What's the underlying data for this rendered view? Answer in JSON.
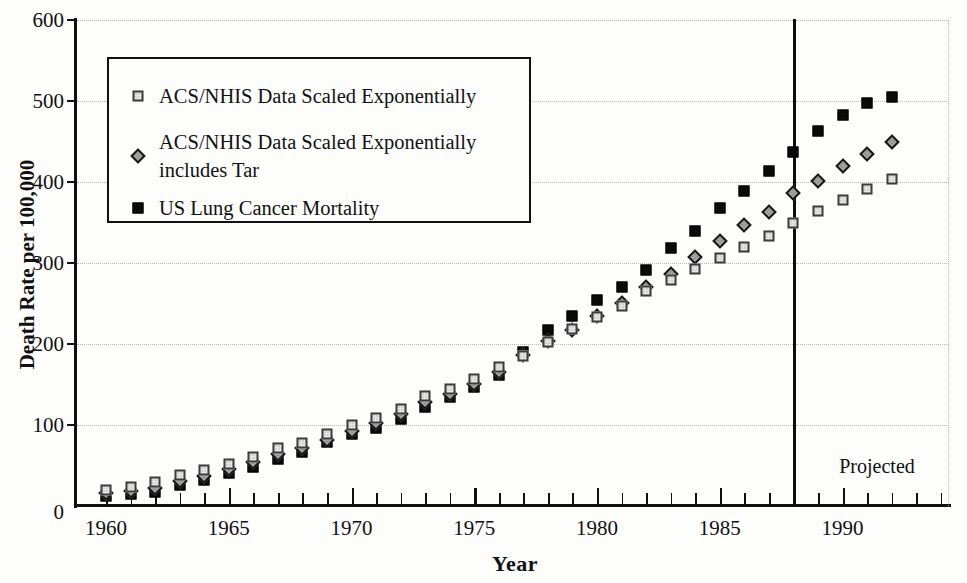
{
  "figure_type": "scanned-book-figure",
  "chart_data": {
    "type": "scatter",
    "title": "",
    "xlabel": "Year",
    "ylabel": "Death Rate per 100,000",
    "xlim": [
      1959,
      1994.6
    ],
    "ylim": [
      0,
      600
    ],
    "grid": "horizontal-dotted",
    "y_ticks": [
      0,
      100,
      200,
      300,
      400,
      500,
      600
    ],
    "x_major_ticks": [
      1960,
      1965,
      1970,
      1975,
      1980,
      1985,
      1990
    ],
    "x_minor_tick_start": 1960,
    "x_minor_tick_end": 1994,
    "vertical_line_year": 1988,
    "annotation": {
      "label": "Projected",
      "region": "right-of-vertical-line-near-axis"
    },
    "legend_position": "upper-left",
    "x": [
      1960,
      1961,
      1962,
      1963,
      1964,
      1965,
      1966,
      1967,
      1968,
      1969,
      1970,
      1971,
      1972,
      1973,
      1974,
      1975,
      1976,
      1977,
      1978,
      1979,
      1980,
      1981,
      1982,
      1983,
      1984,
      1985,
      1986,
      1987,
      1988,
      1989,
      1990,
      1991,
      1992
    ],
    "series": [
      {
        "name": "ACS/NHIS Data Scaled Exponentially",
        "marker": "light-dotted-square",
        "values": [
          20,
          23,
          30,
          38,
          44,
          52,
          61,
          71,
          78,
          89,
          100,
          109,
          120,
          136,
          145,
          157,
          172,
          185,
          202,
          219,
          233,
          247,
          265,
          279,
          292,
          306,
          320,
          333,
          350,
          364,
          378,
          391,
          404
        ]
      },
      {
        "name": "ACS/NHIS Data Scaled Exponentially includes Tar",
        "marker": "gray-diamond",
        "values": [
          16,
          19,
          22,
          31,
          37,
          46,
          54,
          64,
          71,
          82,
          93,
          103,
          113,
          128,
          138,
          151,
          165,
          186,
          204,
          217,
          235,
          251,
          270,
          287,
          307,
          327,
          347,
          363,
          387,
          401,
          420,
          435,
          449
        ]
      },
      {
        "name": "US Lung Cancer Mortality",
        "marker": "black-square",
        "values": [
          12,
          15,
          17,
          26,
          32,
          41,
          48,
          58,
          67,
          79,
          89,
          96,
          108,
          122,
          134,
          147,
          162,
          190,
          217,
          235,
          254,
          270,
          291,
          318,
          340,
          368,
          389,
          413,
          437,
          463,
          483,
          497,
          505
        ]
      }
    ]
  }
}
